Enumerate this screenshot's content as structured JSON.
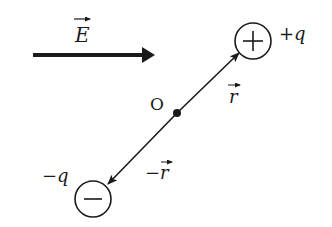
{
  "diagram": {
    "field": {
      "label": "E",
      "vector": true,
      "direction": "right"
    },
    "origin": {
      "label": "O"
    },
    "positive_charge": {
      "symbol": "+",
      "label": "+q"
    },
    "negative_charge": {
      "symbol": "−",
      "label": "−q"
    },
    "position_vector": {
      "label": "r",
      "vector": true
    },
    "negative_position_vector": {
      "label": "−r",
      "vector": true
    },
    "colors": {
      "ink": "#1a1a1a",
      "background": "#ffffff"
    }
  }
}
